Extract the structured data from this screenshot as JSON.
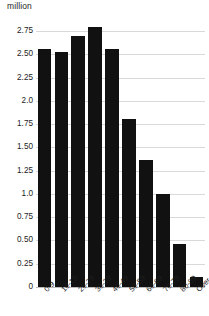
{
  "chart_data": {
    "type": "bar",
    "title": "",
    "subtitle": "",
    "unit_label": "million",
    "xlabel": "",
    "ylabel": "million",
    "ylim": [
      0,
      2.9
    ],
    "grid": true,
    "legend": false,
    "bar_color": "#111111",
    "grid_color": "#d9d9d9",
    "categories": [
      "0-9",
      "10-19",
      "20-29",
      "30-39",
      "40-49",
      "50-59",
      "60-69",
      "70-79",
      "80-89",
      "Over 90"
    ],
    "values": [
      2.56,
      2.52,
      2.7,
      2.79,
      2.56,
      1.8,
      1.36,
      1.0,
      0.46,
      0.11
    ],
    "ytick_labels": [
      "2.75",
      "2.50",
      "2.25",
      "2.0",
      "1.75",
      "1.50",
      "1.25",
      "1.0",
      "0.75",
      "0.50",
      "0.25",
      "0"
    ],
    "ytick_values": [
      2.75,
      2.5,
      2.25,
      2.0,
      1.75,
      1.5,
      1.25,
      1.0,
      0.75,
      0.5,
      0.25,
      0
    ]
  }
}
